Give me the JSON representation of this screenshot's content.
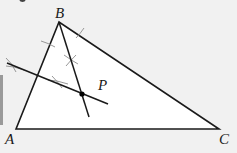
{
  "figure": {
    "colors": {
      "background": "#f1f1f1",
      "triangle_fill": "#ffffff",
      "line": "#1a1a1a",
      "arc_marks": "#8c8c8c",
      "point": "#000000"
    },
    "vertices": {
      "A": {
        "label": "A",
        "x": 16,
        "y": 129
      },
      "B": {
        "label": "B",
        "x": 59,
        "y": 22
      },
      "C": {
        "label": "C",
        "x": 219,
        "y": 129
      }
    },
    "point_P": {
      "label": "P",
      "x": 82,
      "y": 94
    },
    "construction_lines": [
      {
        "name": "cevian-from-B",
        "x1": 59,
        "y1": 22,
        "x2": 89,
        "y2": 117
      },
      {
        "name": "perpendicular-bisector",
        "x1": 7,
        "y1": 63,
        "x2": 108,
        "y2": 104
      }
    ],
    "arc_marks": [
      {
        "x": 48,
        "y": 44
      },
      {
        "x": 80,
        "y": 34
      },
      {
        "x": 71,
        "y": 60
      },
      {
        "x": 12,
        "y": 66
      },
      {
        "x": 58,
        "y": 82
      }
    ]
  }
}
